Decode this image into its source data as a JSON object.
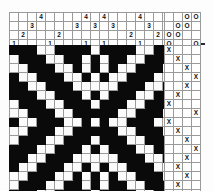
{
  "title": "Weaving draft diagram",
  "legend": {
    "threading_label": "threading",
    "tieup_label": "tie-up",
    "treadling_label": "treadling",
    "drawdown_label": "drawdown"
  },
  "symbols": {
    "tieup_mark": "O",
    "treadling_mark": "X",
    "empty": ""
  },
  "colors": {
    "warp": "#0a0a0a",
    "weft": "#fbfbfb",
    "gridline": "#9a9a9a",
    "frame": "#2b2b2b"
  },
  "chart_data": {
    "type": "heatmap",
    "title": "Weaving draft diagram",
    "xlabel": "",
    "ylabel": "",
    "grid": true,
    "legend_position": "none",
    "threading": {
      "shafts": 4,
      "columns": 19,
      "shaft_labels": [
        "4",
        "3",
        "2",
        "1"
      ],
      "rows": [
        [
          "",
          "",
          "",
          "4",
          "",
          "",
          "",
          "",
          "4",
          "",
          "4",
          "",
          "",
          "",
          "4",
          "",
          "",
          "",
          ""
        ],
        [
          "",
          "",
          "3",
          "",
          "",
          "",
          "",
          "3",
          "",
          "3",
          "",
          "3",
          "",
          "",
          "",
          "3",
          "",
          "",
          ""
        ],
        [
          "",
          "2",
          "",
          "",
          "",
          "2",
          "",
          "",
          "",
          "",
          "",
          "",
          "",
          "2",
          "",
          "",
          "2",
          "",
          ""
        ],
        [
          "1",
          "",
          "",
          "",
          "1",
          "",
          "",
          "",
          "1",
          "",
          "1",
          "",
          "",
          "",
          "1",
          "",
          "",
          "",
          "1"
        ]
      ]
    },
    "tieup": {
      "rows": 4,
      "columns": 4,
      "cells": [
        [
          "",
          "",
          "O",
          "O"
        ],
        [
          "",
          "O",
          "O",
          ""
        ],
        [
          "O",
          "O",
          "",
          ""
        ],
        [
          "O",
          "",
          "",
          "O"
        ]
      ]
    },
    "treadling": {
      "rows": 17,
      "columns": 4,
      "cells": [
        [
          "X",
          "",
          "",
          ""
        ],
        [
          "",
          "X",
          "",
          ""
        ],
        [
          "",
          "",
          "X",
          ""
        ],
        [
          "",
          "",
          "",
          "X"
        ],
        [
          "",
          "",
          "X",
          ""
        ],
        [
          "",
          "X",
          "",
          ""
        ],
        [
          "X",
          "",
          "",
          ""
        ],
        [
          "",
          "",
          "",
          "X"
        ],
        [
          "X",
          "",
          "",
          ""
        ],
        [
          "",
          "X",
          "",
          ""
        ],
        [
          "",
          "",
          "X",
          ""
        ],
        [
          "",
          "",
          "",
          "X"
        ],
        [
          "",
          "",
          "X",
          ""
        ],
        [
          "",
          "X",
          "",
          ""
        ],
        [
          "",
          "",
          "X",
          ""
        ],
        [
          "",
          "X",
          "",
          ""
        ],
        [
          "X",
          "",
          "",
          ""
        ]
      ]
    },
    "drawdown": {
      "rows": 17,
      "columns": 19,
      "on_value": 1,
      "off_value": 0,
      "cells": [
        [
          1,
          1,
          1,
          0,
          0,
          1,
          1,
          1,
          1,
          0,
          1,
          1,
          1,
          1,
          0,
          0,
          1,
          1,
          1
        ],
        [
          0,
          1,
          1,
          1,
          0,
          0,
          1,
          1,
          0,
          1,
          0,
          1,
          1,
          0,
          0,
          1,
          1,
          1,
          0
        ],
        [
          0,
          0,
          1,
          1,
          1,
          0,
          0,
          1,
          0,
          1,
          0,
          1,
          0,
          0,
          1,
          1,
          1,
          0,
          0
        ],
        [
          1,
          0,
          0,
          1,
          1,
          1,
          0,
          0,
          1,
          0,
          1,
          0,
          0,
          1,
          1,
          1,
          0,
          0,
          1
        ],
        [
          1,
          1,
          0,
          0,
          1,
          1,
          1,
          0,
          0,
          0,
          0,
          0,
          1,
          1,
          1,
          0,
          0,
          1,
          1
        ],
        [
          1,
          1,
          1,
          0,
          0,
          1,
          1,
          1,
          0,
          1,
          0,
          1,
          1,
          1,
          0,
          0,
          1,
          1,
          1
        ],
        [
          0,
          1,
          1,
          1,
          0,
          0,
          1,
          1,
          1,
          0,
          1,
          1,
          1,
          0,
          0,
          1,
          1,
          1,
          0
        ],
        [
          0,
          0,
          1,
          1,
          1,
          0,
          0,
          1,
          1,
          1,
          1,
          1,
          0,
          0,
          1,
          1,
          1,
          0,
          0
        ],
        [
          1,
          0,
          0,
          1,
          1,
          1,
          0,
          0,
          1,
          0,
          1,
          0,
          0,
          1,
          1,
          1,
          0,
          0,
          1
        ],
        [
          0,
          0,
          1,
          1,
          1,
          0,
          0,
          1,
          1,
          1,
          1,
          1,
          0,
          0,
          1,
          1,
          1,
          0,
          0
        ],
        [
          0,
          1,
          1,
          1,
          0,
          0,
          1,
          1,
          1,
          0,
          1,
          1,
          1,
          0,
          0,
          1,
          1,
          1,
          0
        ],
        [
          1,
          1,
          1,
          0,
          0,
          1,
          1,
          1,
          0,
          1,
          0,
          1,
          1,
          1,
          0,
          0,
          1,
          1,
          1
        ],
        [
          1,
          1,
          0,
          0,
          1,
          1,
          1,
          0,
          0,
          0,
          0,
          0,
          1,
          1,
          1,
          0,
          0,
          1,
          1
        ],
        [
          1,
          0,
          0,
          1,
          1,
          1,
          0,
          0,
          1,
          0,
          1,
          0,
          0,
          1,
          1,
          1,
          0,
          0,
          1
        ],
        [
          0,
          0,
          1,
          1,
          1,
          0,
          0,
          1,
          0,
          1,
          0,
          1,
          0,
          0,
          1,
          1,
          1,
          0,
          0
        ],
        [
          0,
          1,
          1,
          1,
          0,
          0,
          1,
          1,
          0,
          1,
          0,
          1,
          1,
          0,
          0,
          1,
          1,
          1,
          0
        ],
        [
          1,
          1,
          1,
          0,
          0,
          1,
          1,
          1,
          1,
          0,
          1,
          1,
          1,
          1,
          0,
          0,
          1,
          1,
          1
        ]
      ]
    }
  }
}
